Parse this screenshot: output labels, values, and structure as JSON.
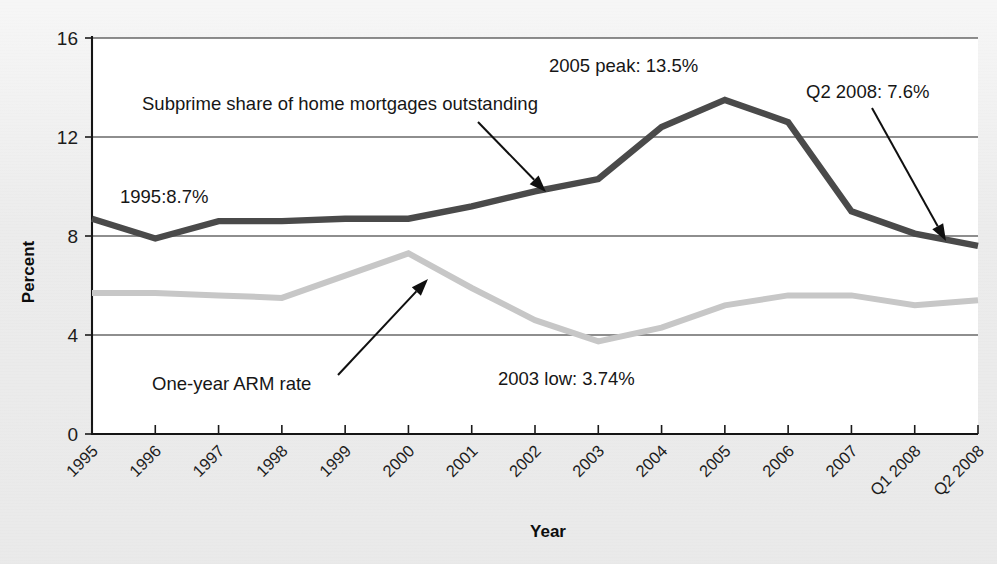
{
  "chart_data": {
    "type": "line",
    "title": "",
    "subtitle": "",
    "xlabel": "Year",
    "ylabel": "Percent",
    "ylim": [
      0,
      16
    ],
    "yticks": [
      0,
      4,
      8,
      12,
      16
    ],
    "ytick_labels": [
      "0",
      "4",
      "8",
      "12",
      "16"
    ],
    "grid": "horizontal",
    "legend_position": "inline-annotations",
    "categories": [
      "1995",
      "1996",
      "1997",
      "1998",
      "1999",
      "2000",
      "2001",
      "2002",
      "2003",
      "2004",
      "2005",
      "2006",
      "2007",
      "Q1 2008",
      "Q2 2008"
    ],
    "series": [
      {
        "name": "Subprime share of home mortgages outstanding",
        "color": "#4a4a4a",
        "values": [
          8.7,
          7.9,
          8.6,
          8.6,
          8.7,
          8.7,
          9.2,
          9.8,
          10.3,
          12.4,
          13.5,
          12.6,
          9.0,
          8.1,
          7.6
        ]
      },
      {
        "name": "One-year ARM rate",
        "color": "#c7c7c7",
        "values": [
          5.7,
          5.7,
          5.6,
          5.5,
          6.4,
          7.3,
          5.9,
          4.6,
          3.74,
          4.3,
          5.2,
          5.6,
          5.6,
          5.2,
          5.4
        ]
      }
    ],
    "annotations": [
      {
        "id": "series-label-subprime",
        "text": "Subprime share of home mortgages outstanding",
        "x": 142,
        "y": 110,
        "arrow": {
          "x1": 478,
          "y1": 122,
          "x2": 546,
          "y2": 192
        }
      },
      {
        "id": "peak-2005",
        "text": "2005 peak: 13.5%",
        "x": 549,
        "y": 72,
        "arrow": null
      },
      {
        "id": "value-1995",
        "text": "1995:8.7%",
        "x": 120,
        "y": 203,
        "arrow": null
      },
      {
        "id": "value-q2-2008",
        "text": "Q2 2008: 7.6%",
        "x": 806,
        "y": 98,
        "arrow": {
          "x1": 872,
          "y1": 108,
          "x2": 946,
          "y2": 241
        }
      },
      {
        "id": "series-label-arm",
        "text": "One-year ARM rate",
        "x": 152,
        "y": 390,
        "arrow": {
          "x1": 338,
          "y1": 375,
          "x2": 428,
          "y2": 279
        }
      },
      {
        "id": "low-2003",
        "text": "2003 low: 3.74%",
        "x": 498,
        "y": 385,
        "arrow": null
      }
    ]
  },
  "colors": {
    "subprime": "#4a4a4a",
    "arm": "#c7c7c7",
    "axis": "#151515",
    "background": "#ececec"
  }
}
